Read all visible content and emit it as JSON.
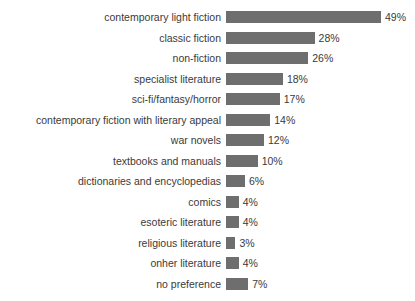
{
  "chart_data": {
    "type": "bar",
    "orientation": "horizontal",
    "title": "",
    "xlabel": "",
    "ylabel": "",
    "xlim": [
      0,
      49
    ],
    "grid": false,
    "legend": null,
    "value_suffix": "%",
    "bar_color": "#6e6e6e",
    "text_color": "#3a3a3a",
    "background_color": "#ffffff",
    "categories": [
      "contemporary light fiction",
      "classic fiction",
      "non-fiction",
      "specialist literature",
      "sci-fi/fantasy/horror",
      "contemporary fiction with literary appeal",
      "war novels",
      "textbooks and manuals",
      "dictionaries and encyclopedias",
      "comics",
      "esoteric literature",
      "religious literature",
      "onher literature",
      "no preference"
    ],
    "values": [
      49,
      28,
      26,
      18,
      17,
      14,
      12,
      10,
      6,
      4,
      4,
      3,
      4,
      7
    ],
    "value_labels": [
      "49%",
      "28%",
      "26%",
      "18%",
      "17%",
      "14%",
      "12%",
      "10%",
      "6%",
      "4%",
      "4%",
      "3%",
      "4%",
      "7%"
    ]
  }
}
